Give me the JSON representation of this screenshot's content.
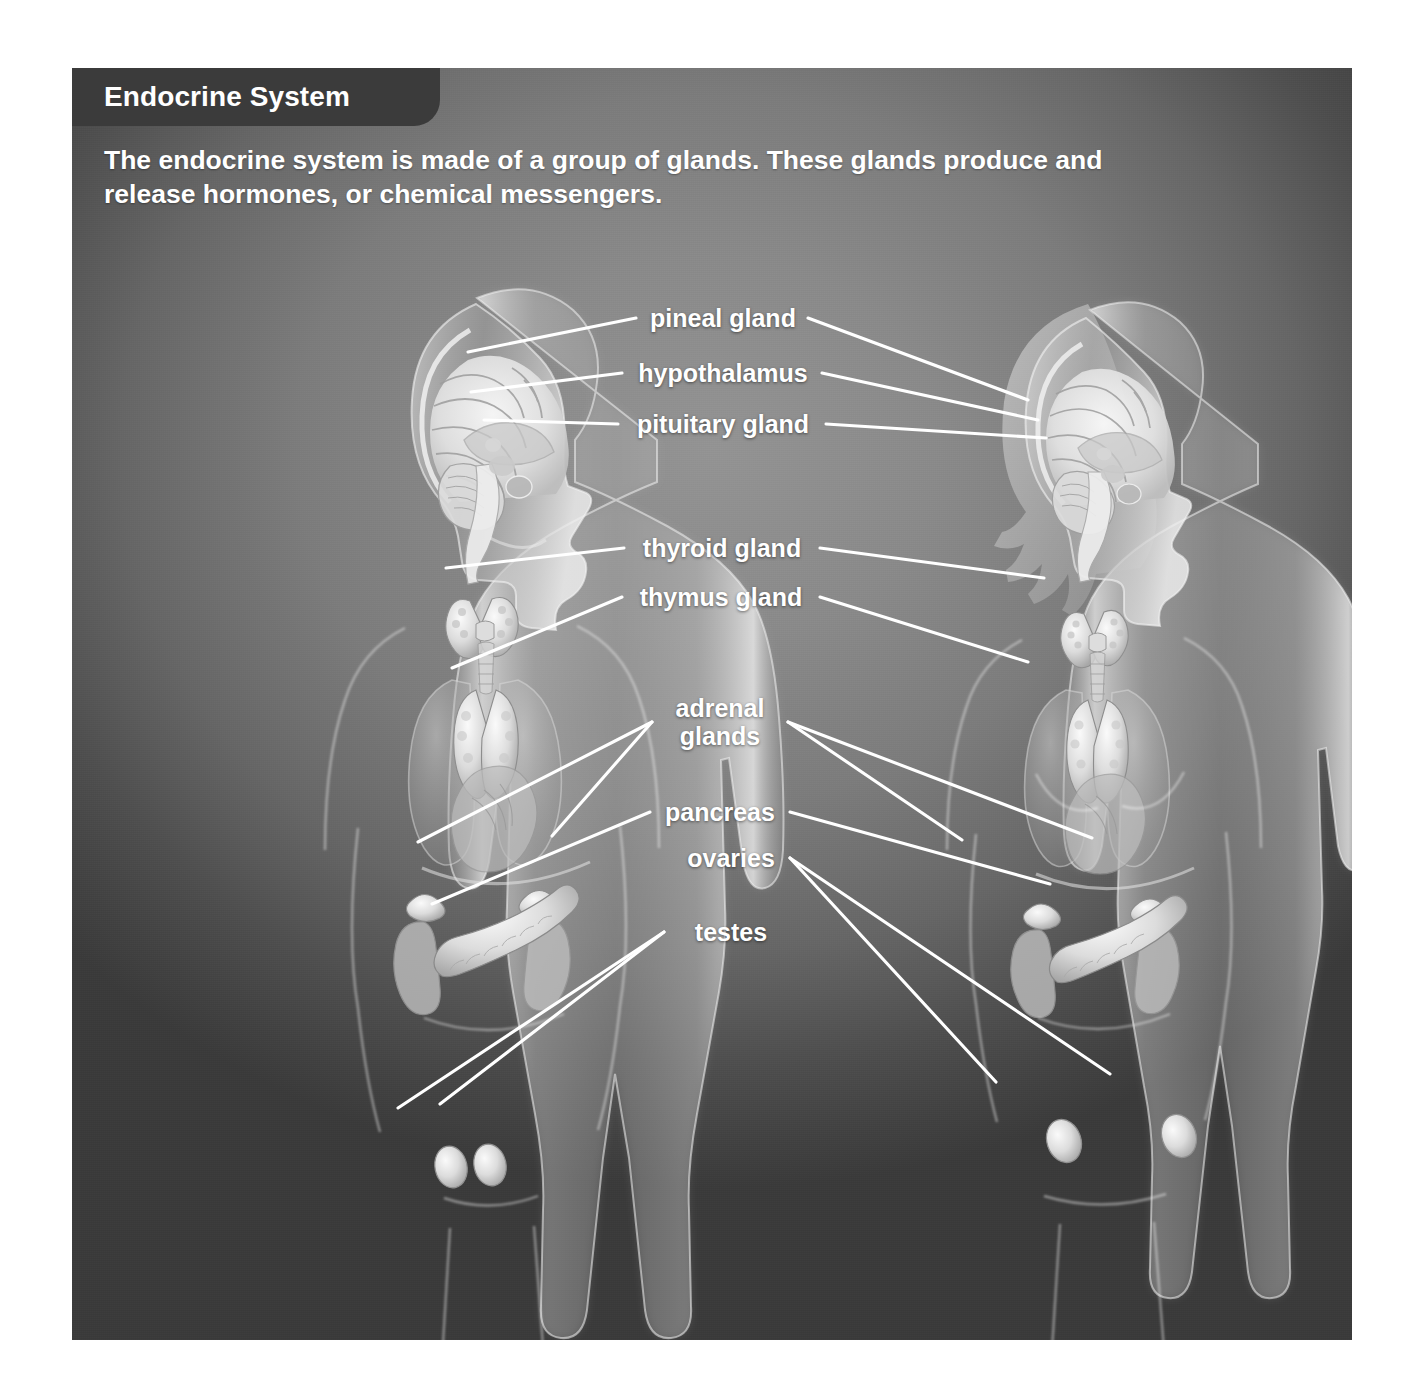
{
  "panel": {
    "title": "Endocrine System",
    "intro": "The endocrine system is made of a group of glands. These glands produce and release hormones, or chemical messengers.",
    "title_bar_color": "#3b3b3b",
    "background_color": "#7c7c7c",
    "text_color": "#ffffff",
    "leader_line_color": "#ffffff"
  },
  "figures": [
    {
      "id": "male-figure",
      "name": "male anatomical figure",
      "side": "left"
    },
    {
      "id": "female-figure",
      "name": "female anatomical figure",
      "side": "right"
    }
  ],
  "labels": [
    {
      "key": "pineal",
      "text": "pineal gland",
      "align": "center"
    },
    {
      "key": "hypothalamus",
      "text": "hypothalamus",
      "align": "center"
    },
    {
      "key": "pituitary",
      "text": "pituitary gland",
      "align": "center"
    },
    {
      "key": "thyroid",
      "text": "thyroid gland",
      "align": "center"
    },
    {
      "key": "thymus",
      "text": "thymus gland",
      "align": "center"
    },
    {
      "key": "adrenal",
      "text": "adrenal\nglands",
      "align": "center"
    },
    {
      "key": "pancreas",
      "text": "pancreas",
      "align": "center"
    },
    {
      "key": "ovaries",
      "text": "ovaries",
      "align": "center"
    },
    {
      "key": "testes",
      "text": "testes",
      "align": "center"
    }
  ],
  "organs": [
    "pineal gland",
    "hypothalamus",
    "pituitary gland",
    "thyroid gland",
    "thymus gland",
    "adrenal glands",
    "pancreas",
    "ovaries",
    "testes"
  ]
}
